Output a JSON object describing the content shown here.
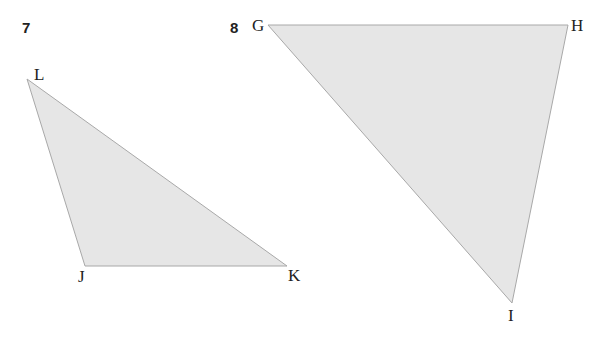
{
  "problems": [
    {
      "number": "7",
      "vertices": {
        "a": "L",
        "b": "J",
        "c": "K"
      }
    },
    {
      "number": "8",
      "vertices": {
        "a": "G",
        "b": "H",
        "c": "I"
      }
    }
  ],
  "colors": {
    "fill": "#e6e6e6",
    "stroke": "#a8a8a8",
    "text": "#222222"
  }
}
